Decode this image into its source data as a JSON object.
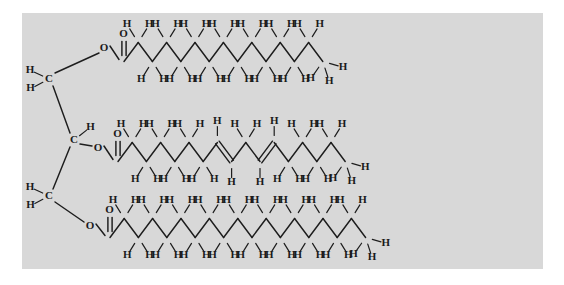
{
  "figure": {
    "background_color": "#ffffff",
    "panel_color": "#d8d8d8",
    "bond_color": "#1d1d1d",
    "atom_label_color": "#1a1a1a",
    "atom_labels": {
      "carbon": "C",
      "hydrogen": "H",
      "oxygen": "O"
    }
  },
  "chart_data": {
    "type": "diagram",
    "subtype": "chemical-structure",
    "molecule": "triglyceride (fat) — glycerol backbone esterified to three fatty acid chains",
    "backbone": {
      "name": "glycerol",
      "carbons": [
        {
          "id": "C1",
          "label": "C",
          "hydrogens": 2,
          "h_positions": [
            "upper-left",
            "lower-left"
          ],
          "ester_oxygen": "O1"
        },
        {
          "id": "C2",
          "label": "C",
          "hydrogens": 1,
          "h_positions": [
            "upper-right"
          ],
          "ester_oxygen": "O2"
        },
        {
          "id": "C3",
          "label": "C",
          "hydrogens": 2,
          "h_positions": [
            "upper-left",
            "lower-left"
          ],
          "ester_oxygen": "O3"
        }
      ]
    },
    "chains": [
      {
        "id": "chain-top",
        "position": "top",
        "saturation": "saturated",
        "ester_oxygen_label": "O",
        "carbonyl_oxygen_label": "O",
        "carbonyl_bond": "double",
        "backbone_carbons": 14,
        "double_bonds": [],
        "terminal_group": "CH3",
        "h_count_upper_row": 14,
        "h_count_lower_row": 12,
        "h_count_terminal": 1
      },
      {
        "id": "chain-middle",
        "position": "middle",
        "saturation": "unsaturated",
        "ester_oxygen_label": "O",
        "carbonyl_oxygen_label": "O",
        "carbonyl_bond": "double",
        "backbone_carbons": 16,
        "double_bonds": [
          {
            "between": [
              8,
              9
            ],
            "geometry": "cis"
          },
          {
            "between": [
              11,
              12
            ],
            "geometry": "cis"
          }
        ],
        "terminal_group": "CH3",
        "h_count_upper_row": 14,
        "h_count_lower_row": 14,
        "h_count_terminal": 1
      },
      {
        "id": "chain-bottom",
        "position": "bottom",
        "saturation": "saturated",
        "ester_oxygen_label": "O",
        "carbonyl_oxygen_label": "O",
        "carbonyl_bond": "double",
        "backbone_carbons": 18,
        "double_bonds": [],
        "terminal_group": "CH3",
        "h_count_upper_row": 16,
        "h_count_lower_row": 16,
        "h_count_terminal": 1
      }
    ]
  }
}
